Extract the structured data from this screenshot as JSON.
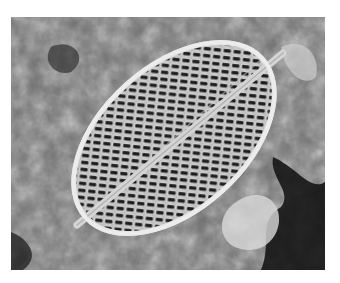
{
  "image": {
    "subject": "Scanning electron micrograph of an elliptical diatom valve",
    "description": "Grayscale SEM image of a diatom frustule with a central raphe and rows of slit-like striae, resting on rough mineral debris",
    "colors": {
      "border": "#ffffff",
      "valve": "#d8d8d8",
      "pores": "#1e1e1e",
      "background_light": "#b5b5b5",
      "background_dark": "#101010"
    }
  }
}
